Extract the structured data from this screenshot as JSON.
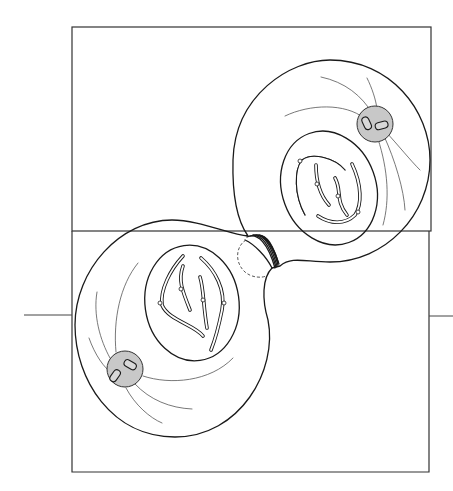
{
  "figure": {
    "colors": {
      "line": "#1a1a1a",
      "spindle_fiber": "#555555",
      "centrosome_fill": "#c8c8c8",
      "background": "#ffffff"
    },
    "frame": {
      "x": 73,
      "y": 27,
      "width": 358,
      "height": 204
    },
    "axis_line_y": 315,
    "cells": [
      {
        "name": "upper-right-daughter-cell",
        "chromosome_count": 4,
        "centrosome": "upper-right",
        "centriole_count": 2
      },
      {
        "name": "lower-left-daughter-cell",
        "chromosome_count": 4,
        "centrosome": "lower-left",
        "centriole_count": 2
      }
    ],
    "cleavage_furrow": {
      "label": "contractile ring",
      "position": "center"
    }
  }
}
